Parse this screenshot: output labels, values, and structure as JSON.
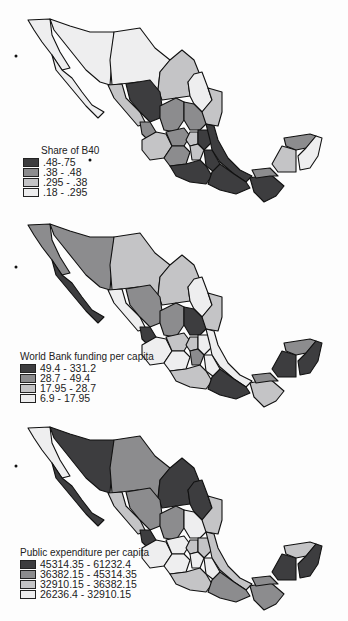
{
  "palette": {
    "class1": "#3d3d3f",
    "class2": "#8c8c8e",
    "class3": "#c4c4c6",
    "class4": "#eeeeef",
    "outline": "#111111"
  },
  "maps": [
    {
      "id": "share-b40",
      "legend": {
        "title": "Share of B40",
        "classes": [
          {
            "label": ".48-.75",
            "color": "#3d3d3f"
          },
          {
            "label": ".38 - .48",
            "color": "#8c8c8e"
          },
          {
            "label": ".295 - .38",
            "color": "#c4c4c6"
          },
          {
            "label": ".18 - .295",
            "color": "#eeeeef"
          }
        ]
      }
    },
    {
      "id": "world-bank-funding",
      "legend": {
        "title": "World Bank funding per capita",
        "classes": [
          {
            "label": "49.4 - 331.2",
            "color": "#3d3d3f"
          },
          {
            "label": "28.7 - 49.4",
            "color": "#8c8c8e"
          },
          {
            "label": "17.95 - 28.7",
            "color": "#c4c4c6"
          },
          {
            "label": "6.9 - 17.95",
            "color": "#eeeeef"
          }
        ]
      }
    },
    {
      "id": "public-expenditure",
      "legend": {
        "title": "Public expenditure per capita",
        "classes": [
          {
            "label": "45314.35 - 61232.4",
            "color": "#3d3d3f"
          },
          {
            "label": "36382.15 - 45314.35",
            "color": "#8c8c8e"
          },
          {
            "label": "32910.15 - 36382.15",
            "color": "#c4c4c6"
          },
          {
            "label": "26236.4 - 32910.15",
            "color": "#eeeeef"
          }
        ]
      }
    }
  ]
}
